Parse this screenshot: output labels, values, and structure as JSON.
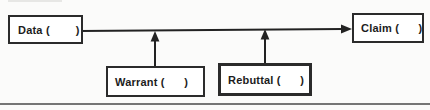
{
  "diagram": {
    "type": "argument-structure-diagram",
    "boxes": {
      "data": {
        "text": "Data (        )"
      },
      "claim": {
        "text": "Claim (      )"
      },
      "warrant": {
        "text": "Warrant (      )"
      },
      "rebuttal": {
        "text": "Rebuttal (      )"
      }
    },
    "arrows": [
      {
        "from": "data",
        "to": "claim",
        "direction": "right"
      },
      {
        "from": "warrant",
        "to": "data-claim-arrow",
        "direction": "up"
      },
      {
        "from": "rebuttal",
        "to": "data-claim-arrow",
        "direction": "up"
      }
    ],
    "colors": {
      "background": "#fbfbfa",
      "line": "#222222",
      "box_border": "#2b2b2b",
      "rebuttal_border": "#1c1c1c",
      "bottom_rule": "#757575",
      "top_artifact": "#e7e7e5"
    }
  }
}
